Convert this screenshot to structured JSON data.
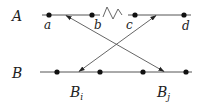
{
  "rows": {
    "A": {
      "label": "A"
    },
    "B": {
      "label": "B"
    }
  },
  "points_A": [
    {
      "name": "a",
      "label": "a"
    },
    {
      "name": "b",
      "label": "b"
    },
    {
      "name": "c",
      "label": "c"
    },
    {
      "name": "d",
      "label": "d"
    }
  ],
  "points_B_labels": {
    "Bi": {
      "main": "B",
      "sub": "i"
    },
    "Bj": {
      "main": "B",
      "sub": "j"
    }
  },
  "colors": {
    "line": "#444444",
    "point": "#111111",
    "arrow": "#555555"
  }
}
